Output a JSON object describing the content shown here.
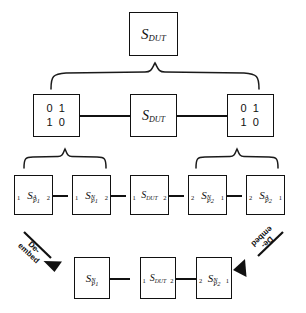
{
  "figure": {
    "background_color": "#ffffff",
    "line_color": "#111111"
  },
  "row1": {
    "dut": {
      "base": "S",
      "sub": "DUT"
    }
  },
  "row2": {
    "left_identity": {
      "line1": "0 1",
      "line2": "1 0"
    },
    "dut": {
      "base": "S",
      "sub": "DUT"
    },
    "right_identity": {
      "line1": "0 1",
      "line2": "1 0"
    }
  },
  "row3": {
    "blocks": [
      {
        "base": "S",
        "sup": "A",
        "sub": "P1",
        "port_left": "1",
        "port_right": "2"
      },
      {
        "base": "S",
        "sup": "N",
        "sub": "P1",
        "port_left": "1",
        "port_right": "2"
      },
      {
        "base": "S",
        "sup": "",
        "sub": "DUT",
        "port_left": "1",
        "port_right": "2"
      },
      {
        "base": "S",
        "sup": "N",
        "sub": "P2",
        "port_left": "2",
        "port_right": "1"
      },
      {
        "base": "S",
        "sup": "A",
        "sub": "P2",
        "port_left": "2",
        "port_right": "1"
      }
    ]
  },
  "row4": {
    "blocks": [
      {
        "base": "S",
        "sup": "N",
        "sub": "P1",
        "port_left": "",
        "port_right": ""
      },
      {
        "base": "S",
        "sup": "",
        "sub": "DUT",
        "port_left": "1",
        "port_right": "2"
      },
      {
        "base": "S",
        "sup": "N",
        "sub": "P2",
        "port_left": "2",
        "port_right": "1"
      }
    ],
    "deembed_left": {
      "line1": "De-",
      "line2": "embed"
    },
    "deembed_right": {
      "line1": "De-",
      "line2": "embed"
    }
  }
}
